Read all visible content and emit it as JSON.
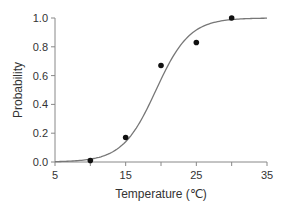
{
  "chart_data": {
    "type": "scatter",
    "title": "",
    "xlabel": "Temperature (℃)",
    "ylabel": "Probability",
    "xlim": [
      5,
      35
    ],
    "ylim": [
      0,
      1.0
    ],
    "x_ticks": [
      5,
      15,
      25,
      35
    ],
    "x_minor_ticks": [
      10,
      20,
      30
    ],
    "y_ticks": [
      0.0,
      0.2,
      0.4,
      0.6,
      0.8,
      1.0
    ],
    "y_tick_labels": [
      "0.0",
      "0.2",
      "0.4",
      "0.6",
      "0.8",
      "1.0"
    ],
    "grid": false,
    "series": [
      {
        "name": "observed",
        "kind": "points",
        "x": [
          10,
          15,
          20,
          25,
          30
        ],
        "y": [
          0.01,
          0.17,
          0.67,
          0.83,
          1.0
        ]
      },
      {
        "name": "fitted logistic curve",
        "kind": "line",
        "midpoint": 19.3,
        "slope": 0.42
      }
    ]
  },
  "colors": {
    "axis": "#888888",
    "curve": "#777777",
    "points": "#111111",
    "text": "#333333"
  }
}
